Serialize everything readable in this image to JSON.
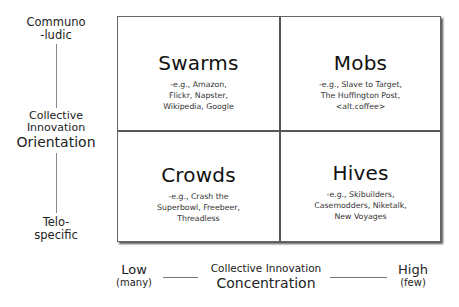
{
  "y_axis": {
    "title_line1": "Collective",
    "title_line2": "Innovation",
    "title_line3": "Orientation",
    "top_label_line1": "Communo",
    "top_label_line2": "-ludic",
    "bottom_label_line1": "Telo-",
    "bottom_label_line2": "specific"
  },
  "x_axis": {
    "title_line1": "Collective Innovation",
    "title_line2": "Concentration",
    "low_label": "Low",
    "low_sub": "(many)",
    "high_label": "High",
    "high_sub": "(few)"
  },
  "quadrants": {
    "top_left": {
      "title": "Swarms",
      "examples": "-e.g., Amazon,\nFlickr,  Napster,\nWikipedia, Google"
    },
    "top_right": {
      "title": "Mobs",
      "examples": "-e.g., Slave to Target,\nThe Huffington Post,\n<alt.coffee>"
    },
    "bottom_left": {
      "title": "Crowds",
      "examples": "-e.g., Crash the\nSuperbowl, Freebeer,\nThreadless"
    },
    "bottom_right": {
      "title": "Hives",
      "examples": "-e.g., Skibuilders,\nCasemodders, Niketalk,\nNew Voyages"
    }
  }
}
